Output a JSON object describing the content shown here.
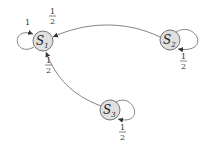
{
  "diagram": {
    "type": "markov-chain",
    "nodes": [
      {
        "id": "S1",
        "label": "S",
        "sub": "1"
      },
      {
        "id": "S2",
        "label": "S",
        "sub": "2"
      },
      {
        "id": "S3",
        "label": "S",
        "sub": "3"
      }
    ],
    "edges": [
      {
        "from": "S1",
        "to": "S1",
        "label": "1"
      },
      {
        "from": "S2",
        "to": "S1",
        "label_num": "1",
        "label_den": "2"
      },
      {
        "from": "S2",
        "to": "S2",
        "label_num": "1",
        "label_den": "2"
      },
      {
        "from": "S3",
        "to": "S1",
        "label_num": "1",
        "label_den": "2"
      },
      {
        "from": "S3",
        "to": "S3",
        "label_num": "1",
        "label_den": "2"
      }
    ]
  }
}
